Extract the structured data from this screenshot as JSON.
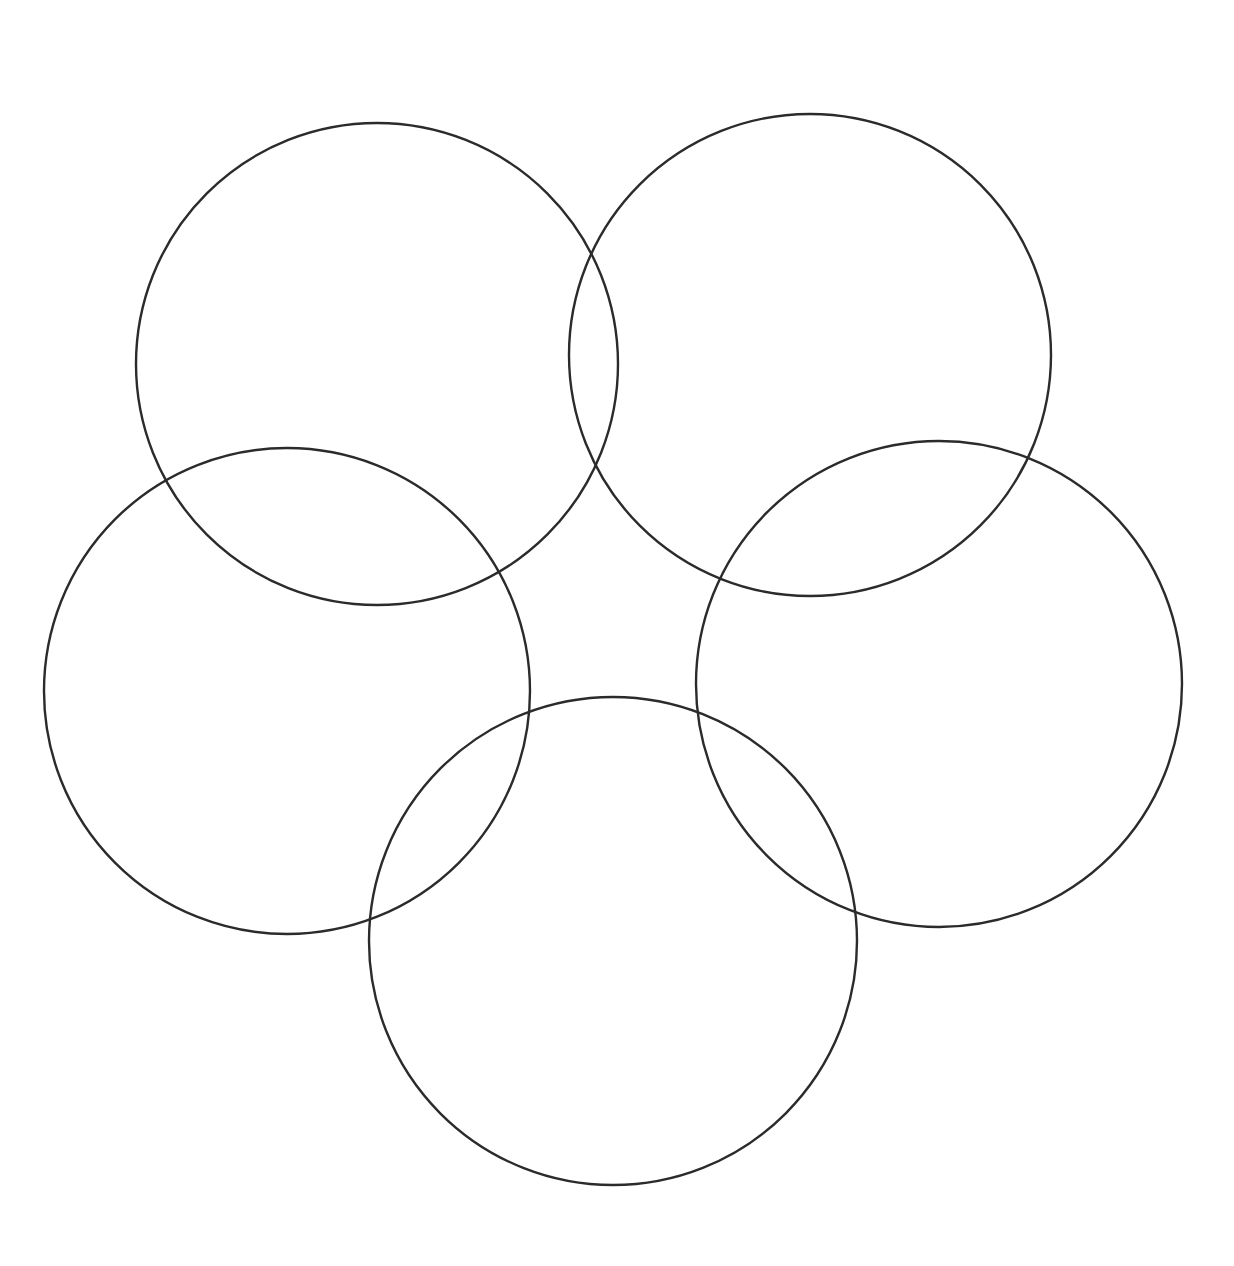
{
  "figure": {
    "title": "Five Interlocking Circles",
    "background_color": "#ffffff",
    "stroke_color": "#2b2b2b",
    "stroke_width": 2.4,
    "fill": "none",
    "canvas": {
      "width": 1234,
      "height": 1266
    }
  },
  "chart_data": {
    "type": "scatter",
    "title": "Five Interlocking Circles",
    "xlabel": "",
    "ylabel": "",
    "xlim": [
      0,
      1234
    ],
    "ylim": [
      0,
      1266
    ],
    "grid": false,
    "legend": "none",
    "shape": "circle-outline",
    "count": 5,
    "arrangement": "pentagonal rosette",
    "stroke_color": "#2b2b2b",
    "stroke_width": 2.4,
    "fill": "none",
    "categories": [
      "top-left",
      "top-right",
      "left",
      "right",
      "bottom"
    ],
    "values": [
      241,
      241,
      243,
      243,
      244
    ],
    "series": [
      {
        "name": "center_x",
        "values": [
          377,
          810,
          287,
          939,
          613
        ]
      },
      {
        "name": "center_y",
        "values": [
          364,
          355,
          691,
          684,
          941
        ]
      },
      {
        "name": "radius",
        "values": [
          241,
          241,
          243,
          243,
          244
        ]
      }
    ],
    "circles": [
      {
        "id": "circle-top-left",
        "label": "top-left",
        "cx": 377,
        "cy": 364,
        "r": 241
      },
      {
        "id": "circle-top-right",
        "label": "top-right",
        "cx": 810,
        "cy": 355,
        "r": 241
      },
      {
        "id": "circle-left",
        "label": "left",
        "cx": 287,
        "cy": 691,
        "r": 243
      },
      {
        "id": "circle-right",
        "label": "right",
        "cx": 939,
        "cy": 684,
        "r": 243
      },
      {
        "id": "circle-bottom",
        "label": "bottom",
        "cx": 613,
        "cy": 941,
        "r": 244
      }
    ]
  }
}
